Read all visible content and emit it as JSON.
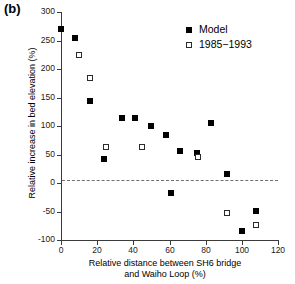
{
  "panel": {
    "label": "(b)"
  },
  "chart_data": {
    "type": "scatter",
    "title": "",
    "xlabel_line1": "Relative distance between SH6 bridge",
    "xlabel_line2": "and Waiho Loop (%)",
    "ylabel": "Relative increase in bed elevation (%)",
    "xlim": [
      0,
      120
    ],
    "ylim": [
      -100,
      300
    ],
    "xticks": [
      0,
      20,
      40,
      60,
      80,
      100,
      120
    ],
    "yticks": [
      -100,
      -50,
      0,
      50,
      100,
      150,
      200,
      250,
      300
    ],
    "xtick_labels": [
      "0",
      "20",
      "40",
      "60",
      "80",
      "100",
      "120"
    ],
    "ytick_labels": [
      "-100",
      "-50",
      "0",
      "50",
      "100",
      "150",
      "200",
      "250",
      "300"
    ],
    "grid": false,
    "legend_position": "top-right",
    "reference_line": {
      "y": 0,
      "style": "dashed",
      "color": "#6f6f6f"
    },
    "series": [
      {
        "name": "Model",
        "marker": "filled-square",
        "color": "#000000",
        "points": [
          {
            "x": 0,
            "y": 270
          },
          {
            "x": 8,
            "y": 255
          },
          {
            "x": 16,
            "y": 143
          },
          {
            "x": 24,
            "y": 42
          },
          {
            "x": 34,
            "y": 114
          },
          {
            "x": 41,
            "y": 114
          },
          {
            "x": 50,
            "y": 100
          },
          {
            "x": 58,
            "y": 85
          },
          {
            "x": 61,
            "y": -17
          },
          {
            "x": 66,
            "y": 57
          },
          {
            "x": 75,
            "y": 52
          },
          {
            "x": 83,
            "y": 105
          },
          {
            "x": 92,
            "y": 16
          },
          {
            "x": 100,
            "y": -85
          },
          {
            "x": 108,
            "y": -49
          }
        ]
      },
      {
        "name": "1985−1993",
        "marker": "open-square",
        "color": "#2b2b2b",
        "points": [
          {
            "x": 10,
            "y": 225
          },
          {
            "x": 16,
            "y": 185
          },
          {
            "x": 25,
            "y": 64
          },
          {
            "x": 45,
            "y": 64
          },
          {
            "x": 76,
            "y": 46
          },
          {
            "x": 92,
            "y": -52
          },
          {
            "x": 108,
            "y": -74
          }
        ]
      }
    ]
  }
}
